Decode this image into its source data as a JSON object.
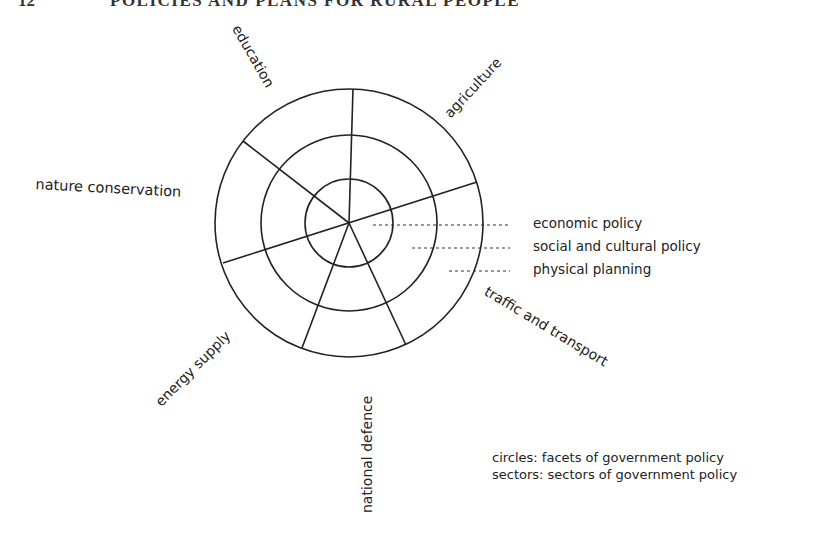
{
  "header": {
    "page_number": "12",
    "title": "POLICIES AND PLANS FOR RURAL PEOPLE"
  },
  "diagram": {
    "center": [
      348,
      222
    ],
    "circle_radii": [
      44,
      88,
      134
    ],
    "stroke_color": "#222222",
    "sectors": [
      {
        "label": "education"
      },
      {
        "label": "agriculture"
      },
      {
        "label": "traffic and transport"
      },
      {
        "label": "national defence"
      },
      {
        "label": "energy supply"
      },
      {
        "label": "nature conservation"
      }
    ],
    "facets": [
      {
        "label": "economic policy"
      },
      {
        "label": "social and cultural policy"
      },
      {
        "label": "physical planning"
      }
    ]
  },
  "notes": {
    "circles": "circles: facets of government policy",
    "sectors": "sectors: sectors of government policy"
  }
}
